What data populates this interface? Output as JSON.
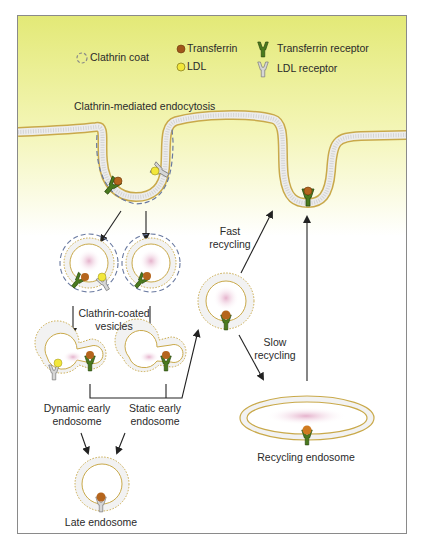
{
  "legend": {
    "clathrin_coat": "Clathrin coat",
    "transferrin": "Transferrin",
    "ldl": "LDL",
    "transferrin_receptor": "Transferrin receptor",
    "ldl_receptor": "LDL receptor"
  },
  "title": "Clathrin-mediated endocytosis",
  "labels": {
    "clathrin_coated_vesicles_line1": "Clathrin-coated",
    "clathrin_coated_vesicles_line2": "vesicles",
    "fast_recycling_line1": "Fast",
    "fast_recycling_line2": "recycling",
    "slow_recycling_line1": "Slow",
    "slow_recycling_line2": "recycling",
    "dynamic_early_line1": "Dynamic early",
    "dynamic_early_line2": "endosome",
    "static_early_line1": "Static early",
    "static_early_line2": "endosome",
    "late_endosome": "Late endosome",
    "recycling_endosome": "Recycling endosome"
  },
  "colors": {
    "background_top": "#e3e977",
    "background_mid": "#fbfbe2",
    "membrane_outline": "#c9a94a",
    "membrane_fill": "#eeeeee",
    "transferrin": "#b5651d",
    "ldl": "#f2e73a",
    "transferrin_receptor": "#4a7a1e",
    "ldl_receptor": "#c8c8c8",
    "lumen": "#e9b8d0",
    "clathrin_coat": "#6a7aa0",
    "arrow": "#222222"
  }
}
